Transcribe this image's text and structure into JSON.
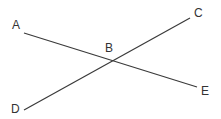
{
  "diagram": {
    "type": "intersecting-lines",
    "line_color": "#3a3a3a",
    "points": [
      {
        "label": "A",
        "x": 24,
        "y": 33,
        "lx": 12,
        "ly": 19
      },
      {
        "label": "B",
        "x": 112,
        "y": 61,
        "lx": 105,
        "ly": 42
      },
      {
        "label": "C",
        "x": 190,
        "y": 18,
        "lx": 194,
        "ly": 7
      },
      {
        "label": "D",
        "x": 24,
        "y": 110,
        "lx": 11,
        "ly": 103
      },
      {
        "label": "E",
        "x": 197,
        "y": 87,
        "lx": 201,
        "ly": 85
      }
    ],
    "segments": [
      {
        "name": "AE",
        "from": "A",
        "to": "E"
      },
      {
        "name": "DC",
        "from": "D",
        "to": "C"
      }
    ]
  }
}
